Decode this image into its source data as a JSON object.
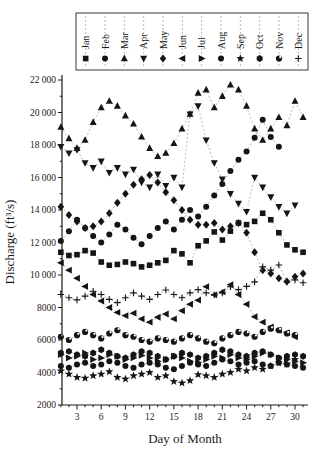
{
  "chart_data": {
    "type": "scatter",
    "title": "",
    "xlabel": "Day of Month",
    "ylabel": "Discharge (ft³/s)",
    "xlim": [
      1,
      31
    ],
    "ylim": [
      2000,
      22000
    ],
    "xticks_major": [
      3,
      6,
      9,
      12,
      15,
      18,
      21,
      24,
      27,
      30
    ],
    "xticks_minor_step": 1,
    "yticks": [
      [
        2000,
        "2000"
      ],
      [
        4000,
        "4000"
      ],
      [
        6000,
        "6000"
      ],
      [
        8000,
        "8000"
      ],
      [
        10000,
        "10 000"
      ],
      [
        12000,
        "12 000"
      ],
      [
        14000,
        "14 000"
      ],
      [
        16000,
        "16 000"
      ],
      [
        18000,
        "18 000"
      ],
      [
        20000,
        "20 000"
      ],
      [
        22000,
        "22 000"
      ]
    ],
    "yticks_minor_step": 1000,
    "grid": false,
    "legend_position": "top",
    "marker_color": "#151515",
    "line_color": "#9a9a9a",
    "line_dash": "2 2",
    "series": [
      {
        "name": "Jan",
        "marker": "square",
        "values": [
          11400,
          11200,
          11250,
          11500,
          11350,
          10800,
          10600,
          10650,
          10800,
          10700,
          10500,
          10600,
          10750,
          10900,
          11500,
          11300,
          10750,
          11800,
          12100,
          12650,
          12150,
          12700,
          13200,
          13100,
          13300,
          13800,
          13400,
          12600,
          11850,
          11550,
          11400
        ]
      },
      {
        "name": "Feb",
        "marker": "circle",
        "values": [
          12100,
          12700,
          13400,
          12900,
          12400,
          12000,
          12500,
          13100,
          12800,
          12300,
          11900,
          12400,
          12900,
          13300,
          12800,
          13400,
          14000,
          13600,
          14200,
          14900,
          15600,
          16400,
          17100,
          17600,
          18450,
          19550,
          18500,
          17900
        ]
      },
      {
        "name": "Mar",
        "marker": "triangle-up",
        "values": [
          19100,
          18400,
          17800,
          18300,
          19400,
          20300,
          20700,
          20400,
          19800,
          19300,
          18500,
          17800,
          17300,
          17500,
          18100,
          19000,
          19900,
          21200,
          21400,
          20300,
          21000,
          21700,
          21400,
          20400,
          19000,
          18300,
          19000,
          19700,
          19200,
          20700,
          19700
        ]
      },
      {
        "name": "Apr",
        "marker": "triangle-down",
        "values": [
          17900,
          17500,
          17700,
          16900,
          16600,
          17000,
          16300,
          16600,
          16200,
          16500,
          15700,
          15400,
          16200,
          15500,
          16000,
          15400,
          19900,
          20400,
          18300,
          16900,
          15900,
          15000,
          14400,
          13900,
          16000,
          15400,
          14800,
          14200,
          13800,
          14300
        ]
      },
      {
        "name": "May",
        "marker": "diamond",
        "values": [
          14200,
          13700,
          13300,
          12900,
          13000,
          13300,
          13800,
          14450,
          15000,
          15550,
          15900,
          16150,
          15700,
          15100,
          14600,
          14000,
          13400,
          13100,
          13100,
          13200,
          12800,
          13000,
          13200,
          12600,
          11400,
          10300,
          10100,
          9800,
          9600,
          9900,
          10100
        ]
      },
      {
        "name": "Jun",
        "marker": "triangle-left",
        "values": [
          10750,
          10300,
          9800,
          9300,
          8800,
          8400,
          8000,
          7700,
          7500,
          7650,
          7300,
          7100,
          7400,
          7600,
          7300,
          7800,
          8200,
          8450,
          9280,
          8780,
          8960,
          9400,
          8800,
          8200,
          7430,
          7100,
          6800,
          6600,
          6450,
          6200
        ]
      },
      {
        "name": "Jul",
        "marker": "triangle-right",
        "values": [
          5100,
          4900,
          5000,
          5200,
          4800,
          4900,
          5100,
          5000,
          4800,
          4900,
          5050,
          4900,
          4700,
          4800,
          5000,
          4900,
          4700,
          4600,
          4800,
          5000,
          4900,
          5100,
          4900,
          4800,
          5000,
          5200,
          5100,
          4900,
          4800,
          4700,
          4600
        ]
      },
      {
        "name": "Aug",
        "marker": "circle",
        "values": [
          4400,
          4300,
          4500,
          4600,
          4400,
          4500,
          4700,
          4600,
          4400,
          4300,
          4500,
          4600,
          4500,
          4300,
          4200,
          4400,
          4600,
          4500,
          4400,
          4600,
          4800,
          4700,
          4500,
          4600,
          4700,
          4500,
          4400,
          4600,
          4500,
          4400,
          4300
        ]
      },
      {
        "name": "Sep",
        "marker": "star",
        "values": [
          4100,
          3900,
          3700,
          3650,
          3800,
          3900,
          4050,
          3700,
          3600,
          3800,
          3900,
          4000,
          3700,
          3800,
          3450,
          3350,
          3500,
          3870,
          3800,
          3700,
          3900,
          4000,
          4200,
          4100,
          4300,
          4200,
          4400,
          4600,
          4500,
          4800
        ]
      },
      {
        "name": "Oct",
        "marker": "hexagon",
        "values": [
          5200,
          5300,
          5100,
          5000,
          5200,
          5400,
          5200,
          5000,
          4900,
          5100,
          5300,
          5200,
          5000,
          4800,
          5000,
          5200,
          5100,
          4900,
          5000,
          5200,
          5400,
          5300,
          5100,
          5000,
          5200,
          5300,
          5100,
          4900,
          5000,
          5100,
          5000
        ]
      },
      {
        "name": "Nov",
        "marker": "circle-notch",
        "values": [
          6200,
          6000,
          6300,
          6500,
          6300,
          6100,
          6400,
          6600,
          6300,
          6200,
          6000,
          5900,
          6100,
          6000,
          5900,
          6100,
          6300,
          6100,
          5900,
          5800,
          6100,
          6300,
          6500,
          6400,
          6200,
          6500,
          6700,
          6600,
          6400,
          6300
        ]
      },
      {
        "name": "Dec",
        "marker": "plus",
        "values": [
          8800,
          8600,
          8470,
          8700,
          9000,
          8800,
          8500,
          8300,
          8600,
          8900,
          8700,
          8500,
          8800,
          9080,
          8800,
          8600,
          8900,
          9100,
          8900,
          8780,
          8900,
          9280,
          9100,
          9300,
          9580,
          10500,
          10300,
          10620,
          9580,
          9700,
          9520
        ]
      }
    ]
  }
}
